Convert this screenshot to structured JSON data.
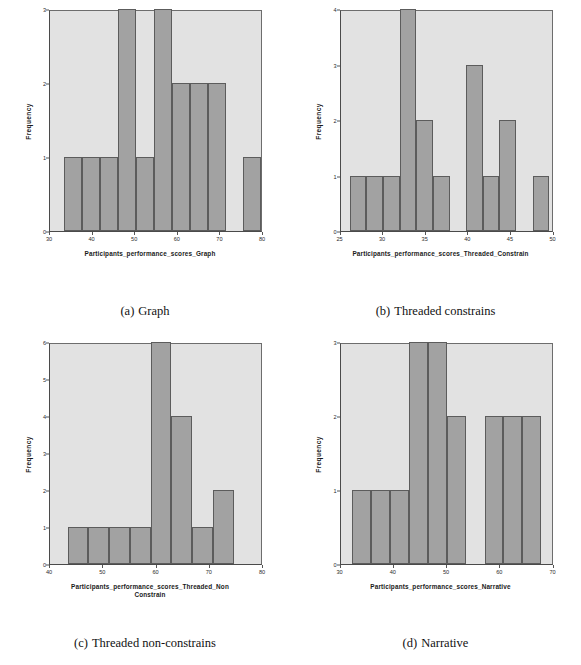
{
  "figure": {
    "panels": [
      {
        "caption_label": "(a)",
        "caption_text": "Graph",
        "chart_data": {
          "type": "bar",
          "title": "",
          "xlabel": "Participants_performance_scores_Graph",
          "ylabel": "Frequency",
          "xlim": [
            30,
            80
          ],
          "ylim": [
            0,
            3
          ],
          "xticks": [
            30,
            40,
            50,
            60,
            70,
            80
          ],
          "yticks": [
            0,
            1,
            2,
            3
          ],
          "bin_width": 4.2,
          "bin_starts": [
            33.4,
            37.6,
            41.8,
            46.0,
            50.2,
            54.4,
            58.6,
            62.8,
            67.0,
            71.2,
            75.4
          ],
          "categories": [
            "33-38",
            "38-42",
            "42-46",
            "46-50",
            "50-54",
            "54-59",
            "59-63",
            "63-67",
            "67-71",
            "71-75",
            "75-80"
          ],
          "values": [
            1,
            1,
            1,
            3,
            1,
            3,
            2,
            2,
            2,
            0,
            1
          ],
          "grid": false,
          "legend": null
        }
      },
      {
        "caption_label": "(b)",
        "caption_text": "Threaded constrains",
        "chart_data": {
          "type": "bar",
          "title": "",
          "xlabel": "Participants_performance_scores_Threaded_Constrain",
          "ylabel": "Frequency",
          "xlim": [
            25,
            50
          ],
          "ylim": [
            0,
            4
          ],
          "xticks": [
            25,
            30,
            35,
            40,
            45,
            50
          ],
          "yticks": [
            0,
            1,
            2,
            3,
            4
          ],
          "bin_width": 1.95,
          "bin_starts": [
            26.1,
            28.05,
            30.0,
            31.95,
            33.9,
            35.85,
            37.8,
            39.75,
            41.7,
            43.65,
            45.6,
            47.55
          ],
          "categories": [
            "26-28",
            "28-30",
            "30-32",
            "32-34",
            "34-36",
            "36-38",
            "38-40",
            "40-42",
            "42-44",
            "44-46",
            "46-48",
            "48-50"
          ],
          "values": [
            1,
            1,
            1,
            4,
            2,
            1,
            0,
            3,
            1,
            2,
            0,
            1
          ],
          "grid": false,
          "legend": null
        }
      },
      {
        "caption_label": "(c)",
        "caption_text": "Threaded non-constrains",
        "chart_data": {
          "type": "bar",
          "title": "",
          "xlabel": "Participants_performance_scores_Threaded_Non\nConstrain",
          "xlabel_line1": "Participants_performance_scores_Threaded_Non",
          "xlabel_line2": "Constrain",
          "ylabel": "Frequency",
          "xlim": [
            40,
            80
          ],
          "ylim": [
            0,
            6
          ],
          "xticks": [
            40,
            50,
            60,
            70,
            80
          ],
          "yticks": [
            0,
            1,
            2,
            3,
            4,
            5,
            6
          ],
          "bin_width": 3.9,
          "bin_starts": [
            43.3,
            47.2,
            51.1,
            55.0,
            58.9,
            62.8,
            66.7,
            70.6
          ],
          "categories": [
            "43-47",
            "47-51",
            "51-55",
            "55-59",
            "59-63",
            "63-67",
            "67-71",
            "71-75"
          ],
          "values": [
            1,
            1,
            1,
            1,
            6,
            4,
            1,
            2
          ],
          "grid": false,
          "legend": null
        }
      },
      {
        "caption_label": "(d)",
        "caption_text": "Narrative",
        "chart_data": {
          "type": "bar",
          "title": "",
          "xlabel": "Participants_performance_scores_Narrative",
          "ylabel": "Frequency",
          "xlim": [
            30,
            70
          ],
          "ylim": [
            0,
            3
          ],
          "xticks": [
            30,
            40,
            50,
            60,
            70
          ],
          "yticks": [
            0,
            1,
            2,
            3
          ],
          "bin_width": 3.55,
          "bin_starts": [
            32.2,
            35.75,
            39.3,
            42.85,
            46.4,
            49.95,
            53.5,
            57.05,
            60.6,
            64.15
          ],
          "categories": [
            "32-36",
            "36-39",
            "39-43",
            "43-46",
            "46-50",
            "50-54",
            "54-57",
            "57-61",
            "61-64",
            "64-68"
          ],
          "values": [
            1,
            1,
            1,
            3,
            3,
            2,
            0,
            2,
            2,
            2
          ],
          "grid": false,
          "legend": null
        }
      }
    ]
  }
}
